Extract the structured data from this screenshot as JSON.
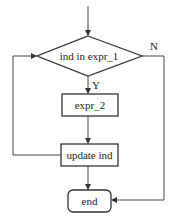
{
  "diagram": {
    "type": "flowchart",
    "nodes": {
      "decision": {
        "label": "ind in expr_1",
        "shape": "diamond"
      },
      "body": {
        "label": "expr_2",
        "shape": "rectangle"
      },
      "update": {
        "label": "update ind",
        "shape": "rectangle"
      },
      "end": {
        "label": "end",
        "shape": "rounded-rectangle"
      }
    },
    "edges": {
      "yes_label": "Y",
      "no_label": "N"
    },
    "colors": {
      "line": "#444444",
      "background": "#ffffff"
    }
  }
}
